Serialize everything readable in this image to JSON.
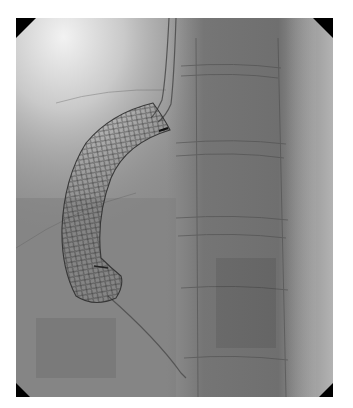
{
  "image": {
    "type": "fluoroscopy",
    "description": "Grayscale fluoroscopic X-ray showing a curved self-expanding mesh stent with an adjacent catheter over a vertebral column",
    "alt": "Fluoroscopic image of a curved mesh stent",
    "colors": {
      "background_page": "#ffffff",
      "field_mid": "#8a8a8a",
      "field_bright": "#d8d8d8",
      "field_dark": "#6e6e6e",
      "stent_wire": "#2b2b2b",
      "corner_mask": "#000000"
    },
    "frame": {
      "left": 16,
      "top": 18,
      "width": 317,
      "height": 379
    }
  }
}
